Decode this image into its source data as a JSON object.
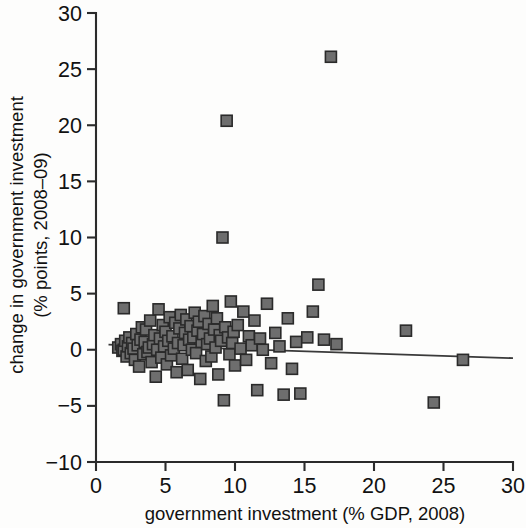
{
  "chart_data": {
    "type": "scatter",
    "title": "",
    "xlabel": "government investment (% GDP, 2008)",
    "ylabel_line1": "change in government investment",
    "ylabel_line2": "(% points, 2008–09)",
    "xlim": [
      0,
      30
    ],
    "ylim": [
      -10,
      30
    ],
    "xticks": [
      0,
      5,
      10,
      15,
      20,
      25,
      30
    ],
    "yticks": [
      -10,
      -5,
      0,
      5,
      10,
      15,
      20,
      25,
      30
    ],
    "xtick_labels": [
      "0",
      "5",
      "10",
      "15",
      "20",
      "25",
      "30"
    ],
    "ytick_labels": [
      "−10",
      "−5",
      "0",
      "5",
      "10",
      "15",
      "20",
      "25",
      "30"
    ],
    "grid": false,
    "legend": null,
    "marker": {
      "shape": "square",
      "fill_color": "#6e6e6e",
      "edge_color": "#2a2a2a",
      "size_px": 11
    },
    "trend_line": {
      "present": true,
      "color": "#3a3a3a",
      "x_start": 0.9,
      "y_start": 0.45,
      "x_end": 30.0,
      "y_end": -0.75
    },
    "series": [
      {
        "name": "countries",
        "points": [
          [
            1.6,
            0.2
          ],
          [
            1.8,
            0.5
          ],
          [
            1.9,
            -0.1
          ],
          [
            2.0,
            0.0
          ],
          [
            2.0,
            3.7
          ],
          [
            2.1,
            0.8
          ],
          [
            2.2,
            -0.6
          ],
          [
            2.3,
            0.3
          ],
          [
            2.4,
            1.1
          ],
          [
            2.5,
            -0.3
          ],
          [
            2.6,
            0.6
          ],
          [
            2.7,
            0.1
          ],
          [
            2.8,
            -0.9
          ],
          [
            2.9,
            1.4
          ],
          [
            3.0,
            0.4
          ],
          [
            3.1,
            -1.5
          ],
          [
            3.2,
            0.9
          ],
          [
            3.3,
            2.0
          ],
          [
            3.4,
            -0.4
          ],
          [
            3.5,
            0.7
          ],
          [
            3.6,
            1.8
          ],
          [
            3.7,
            -0.2
          ],
          [
            3.8,
            0.2
          ],
          [
            3.9,
            2.6
          ],
          [
            4.0,
            -1.1
          ],
          [
            4.1,
            0.5
          ],
          [
            4.2,
            1.3
          ],
          [
            4.3,
            -2.4
          ],
          [
            4.4,
            0.0
          ],
          [
            4.5,
            3.6
          ],
          [
            4.6,
            1.0
          ],
          [
            4.7,
            -0.7
          ],
          [
            4.8,
            2.2
          ],
          [
            4.9,
            0.3
          ],
          [
            5.0,
            1.6
          ],
          [
            5.1,
            -1.3
          ],
          [
            5.2,
            0.8
          ],
          [
            5.3,
            2.9
          ],
          [
            5.4,
            -0.5
          ],
          [
            5.5,
            1.2
          ],
          [
            5.6,
            0.1
          ],
          [
            5.7,
            2.4
          ],
          [
            5.8,
            -2.0
          ],
          [
            5.9,
            0.6
          ],
          [
            6.0,
            1.9
          ],
          [
            6.1,
            3.1
          ],
          [
            6.2,
            -0.8
          ],
          [
            6.3,
            0.4
          ],
          [
            6.4,
            1.5
          ],
          [
            6.5,
            2.7
          ],
          [
            6.6,
            -1.8
          ],
          [
            6.7,
            0.9
          ],
          [
            6.8,
            2.1
          ],
          [
            6.9,
            0.0
          ],
          [
            7.0,
            1.1
          ],
          [
            7.1,
            3.3
          ],
          [
            7.2,
            -0.3
          ],
          [
            7.3,
            1.7
          ],
          [
            7.4,
            2.5
          ],
          [
            7.5,
            -2.6
          ],
          [
            7.6,
            0.7
          ],
          [
            7.7,
            1.4
          ],
          [
            7.8,
            3.0
          ],
          [
            7.9,
            -1.0
          ],
          [
            8.0,
            0.5
          ],
          [
            8.1,
            2.3
          ],
          [
            8.2,
            1.0
          ],
          [
            8.3,
            -0.6
          ],
          [
            8.4,
            3.9
          ],
          [
            8.5,
            1.8
          ],
          [
            8.6,
            0.2
          ],
          [
            8.7,
            2.8
          ],
          [
            8.8,
            -2.2
          ],
          [
            8.9,
            1.3
          ],
          [
            9.0,
            0.8
          ],
          [
            9.1,
            10.0
          ],
          [
            9.2,
            -4.5
          ],
          [
            9.3,
            2.0
          ],
          [
            9.4,
            20.4
          ],
          [
            9.5,
            1.1
          ],
          [
            9.6,
            -0.4
          ],
          [
            9.7,
            4.3
          ],
          [
            9.8,
            0.6
          ],
          [
            9.9,
            1.6
          ],
          [
            10.0,
            -1.4
          ],
          [
            10.2,
            2.2
          ],
          [
            10.4,
            0.1
          ],
          [
            10.6,
            3.4
          ],
          [
            10.8,
            -0.9
          ],
          [
            11.0,
            1.2
          ],
          [
            11.2,
            0.4
          ],
          [
            11.4,
            2.6
          ],
          [
            11.6,
            -3.6
          ],
          [
            11.8,
            1.0
          ],
          [
            12.0,
            0.0
          ],
          [
            12.3,
            4.1
          ],
          [
            12.6,
            -1.2
          ],
          [
            12.9,
            1.5
          ],
          [
            13.2,
            0.3
          ],
          [
            13.5,
            -4.0
          ],
          [
            13.8,
            2.8
          ],
          [
            14.1,
            -1.7
          ],
          [
            14.4,
            0.7
          ],
          [
            14.7,
            -3.9
          ],
          [
            15.2,
            1.1
          ],
          [
            15.6,
            3.4
          ],
          [
            16.0,
            5.8
          ],
          [
            16.4,
            0.9
          ],
          [
            16.9,
            26.1
          ],
          [
            17.3,
            0.5
          ],
          [
            22.3,
            1.7
          ],
          [
            24.3,
            -4.7
          ],
          [
            26.4,
            -0.9
          ]
        ]
      }
    ]
  },
  "axes": {
    "x_title": "government investment (% GDP, 2008)",
    "y_title_line1": "change in government investment",
    "y_title_line2": "(% points, 2008–09)"
  }
}
